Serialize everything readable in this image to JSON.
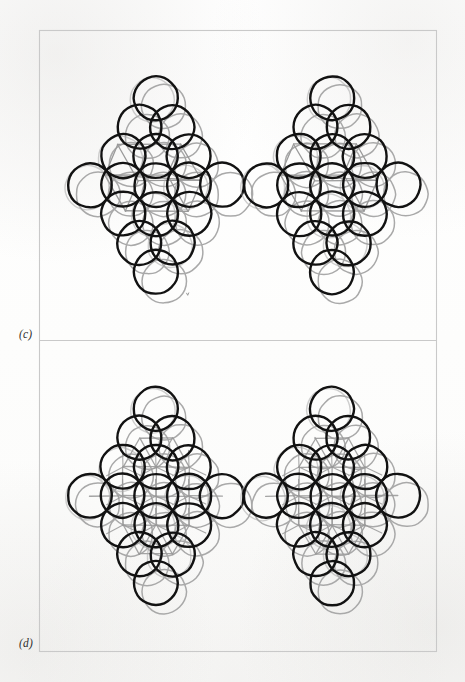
{
  "figure": {
    "kind": "crystal-structure-sphere-packing-figure",
    "background_color": "#fefefe",
    "frame": {
      "x": 39,
      "y": 30,
      "width": 397,
      "height": 621,
      "stroke": "#c9c9c9",
      "divider_y": 340
    },
    "panels": [
      {
        "id": "c",
        "label": "(c)",
        "label_x": 19,
        "label_y": 328,
        "region": {
          "x": 39,
          "y": 30,
          "width": 397,
          "height": 310
        },
        "inner_linework": "parallelepiped-unit-cell-outline",
        "clusters": [
          {
            "id": "c-left",
            "name": "cluster-c-left",
            "center_x": 156,
            "center_y": 185,
            "radius": 22,
            "spacing_x": 33,
            "spacing_y": 29,
            "rows": [
              1,
              2,
              3,
              5,
              3,
              2,
              1
            ],
            "back_layer_offset_x": 8,
            "back_layer_offset_y": 9
          },
          {
            "id": "c-right",
            "name": "cluster-c-right",
            "center_x": 332,
            "center_y": 185,
            "radius": 22,
            "spacing_x": 33,
            "spacing_y": 29,
            "rows": [
              1,
              2,
              3,
              5,
              3,
              2,
              1
            ],
            "back_layer_offset_x": 8,
            "back_layer_offset_y": 9
          }
        ]
      },
      {
        "id": "d",
        "label": "(d)",
        "label_x": 19,
        "label_y": 637,
        "region": {
          "x": 39,
          "y": 340,
          "width": 397,
          "height": 311
        },
        "inner_linework": "tetrahedral-star-bond-network",
        "clusters": [
          {
            "id": "d-left",
            "name": "cluster-d-left",
            "center_x": 156,
            "center_y": 496,
            "radius": 22,
            "spacing_x": 33,
            "spacing_y": 29,
            "rows": [
              1,
              2,
              3,
              5,
              3,
              2,
              1
            ],
            "back_layer_offset_x": 8,
            "back_layer_offset_y": 9
          },
          {
            "id": "d-right",
            "name": "cluster-d-right",
            "center_x": 332,
            "center_y": 496,
            "radius": 22,
            "spacing_x": 33,
            "spacing_y": 29,
            "rows": [
              1,
              2,
              3,
              5,
              3,
              2,
              1
            ],
            "back_layer_offset_x": 8,
            "back_layer_offset_y": 9
          }
        ]
      }
    ],
    "colors": {
      "front_sphere_outline": "#121212",
      "back_sphere_outline": "#a9a9a9",
      "bond_line": "#9a9a9a",
      "frame_line": "#c9c9c9",
      "label_text": "#2e2e2e",
      "page_background": "#fefefe"
    },
    "stroke_widths": {
      "front_sphere": 2.4,
      "back_sphere": 1.5,
      "bond_line": 1.3,
      "frame": 1.1
    }
  }
}
